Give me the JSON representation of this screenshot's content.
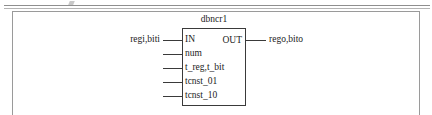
{
  "diagram": {
    "block": {
      "name": "dbncr1",
      "input_ports": [
        {
          "label": "IN",
          "y": 35
        },
        {
          "label": "num",
          "y": 49
        },
        {
          "label": "t_reg,t_bit",
          "y": 63
        },
        {
          "label": "tcnst_01",
          "y": 77
        },
        {
          "label": "tcnst_10",
          "y": 91
        }
      ],
      "output_ports": [
        {
          "label": "OUT",
          "y": 35
        }
      ]
    },
    "signals": {
      "input": {
        "label": "regi,biti",
        "y": 35
      },
      "output": {
        "label": "rego,bito",
        "y": 35
      }
    },
    "colors": {
      "block_stroke": "#3a3a3a",
      "frame_stroke": "#9a9a9a",
      "rule_stroke": "#8f8f8f",
      "text": "#1c1c1c",
      "background": "#ffffff"
    }
  }
}
